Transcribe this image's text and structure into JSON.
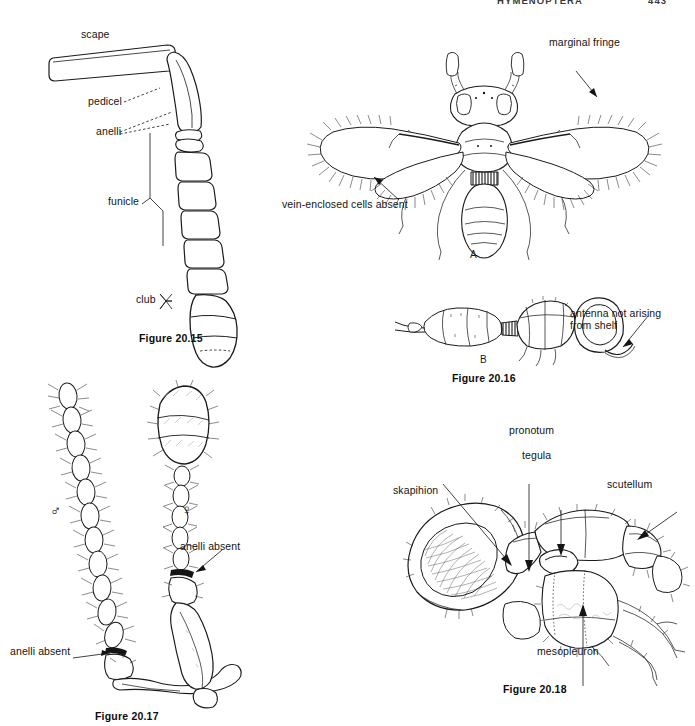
{
  "page": {
    "running_head": "HYMENOPTERA",
    "page_number": "443",
    "background_color": "#ffffff",
    "ink_color": "#1b1b1b"
  },
  "figures": [
    {
      "id": "fig-20-15",
      "caption": "Figure 20.15",
      "subject": "chalcidoid antenna showing segment regions",
      "labels": [
        {
          "key": "scape",
          "text": "scape"
        },
        {
          "key": "pedicel",
          "text": "pedicel"
        },
        {
          "key": "anelli",
          "text": "anelli"
        },
        {
          "key": "funicle",
          "text": "funicle"
        },
        {
          "key": "club",
          "text": "club"
        }
      ]
    },
    {
      "id": "fig-20-16",
      "caption": "Figure 20.16",
      "subject": "mymarid wasp, dorsal habitus and lateral head",
      "panels": [
        {
          "key": "a",
          "letter": "A"
        },
        {
          "key": "b",
          "letter": "B"
        }
      ],
      "labels": [
        {
          "key": "marginal-fringe",
          "text": "marginal fringe"
        },
        {
          "key": "vein-enclosed-cells-absent",
          "text": "vein-enclosed cells absent"
        },
        {
          "key": "antenna-not-arising-from-shelf-line1",
          "text": "antenna not arising"
        },
        {
          "key": "antenna-not-arising-from-shelf-line2",
          "text": "from shelf"
        }
      ]
    },
    {
      "id": "fig-20-17",
      "caption": "Figure 20.17",
      "subject": "male and female antennae lacking anelli",
      "labels": [
        {
          "key": "male-symbol",
          "text": "♂"
        },
        {
          "key": "female-symbol",
          "text": "♀"
        },
        {
          "key": "anelli-absent-female",
          "text": "anelli absent"
        },
        {
          "key": "anelli-absent-male",
          "text": "anelli absent"
        }
      ]
    },
    {
      "id": "fig-20-18",
      "caption": "Figure 20.18",
      "subject": "lateral view of head and thorax",
      "labels": [
        {
          "key": "pronotum",
          "text": "pronotum"
        },
        {
          "key": "tegula",
          "text": "tegula"
        },
        {
          "key": "scutellum",
          "text": "scutellum"
        },
        {
          "key": "skapihion",
          "text": "skapihion"
        },
        {
          "key": "mesopleuron",
          "text": "mesopleuron"
        }
      ]
    }
  ]
}
